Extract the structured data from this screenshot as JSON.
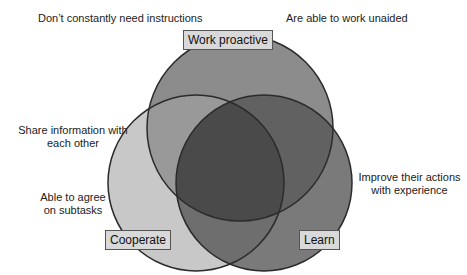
{
  "diagram": {
    "type": "venn",
    "sets": [
      {
        "id": "work_proactive",
        "label": "Work proactive",
        "fill": "#8c8c8c"
      },
      {
        "id": "cooperate",
        "label": "Cooperate",
        "fill": "#c8c8c8"
      },
      {
        "id": "learn",
        "label": "Learn",
        "fill": "#7a7a7a"
      }
    ],
    "intersections": {
      "work_cooperate": "#999999",
      "work_learn": "#616161",
      "cooperate_learn": "#6e6e6e",
      "all_three": "#4a4a4a"
    },
    "outline_color": "#2b2b2b"
  },
  "annotations": {
    "top_left": "Don’t constantly need instructions",
    "top_right": "Are able to work unaided",
    "left_upper_line1": "Share information with",
    "left_upper_line2": "each other",
    "left_lower_line1": "Able to agree",
    "left_lower_line2": "on subtasks",
    "right_line1": "Improve their actions",
    "right_line2": "with experience"
  },
  "labels": {
    "work_proactive": "Work proactive",
    "cooperate": "Cooperate",
    "learn": "Learn"
  }
}
